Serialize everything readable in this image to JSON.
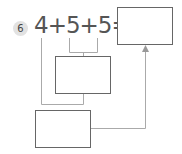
{
  "problem": {
    "number": "6",
    "expression": "4+5+5="
  },
  "boxes": {
    "answer": "",
    "middle": "",
    "bottom": ""
  }
}
